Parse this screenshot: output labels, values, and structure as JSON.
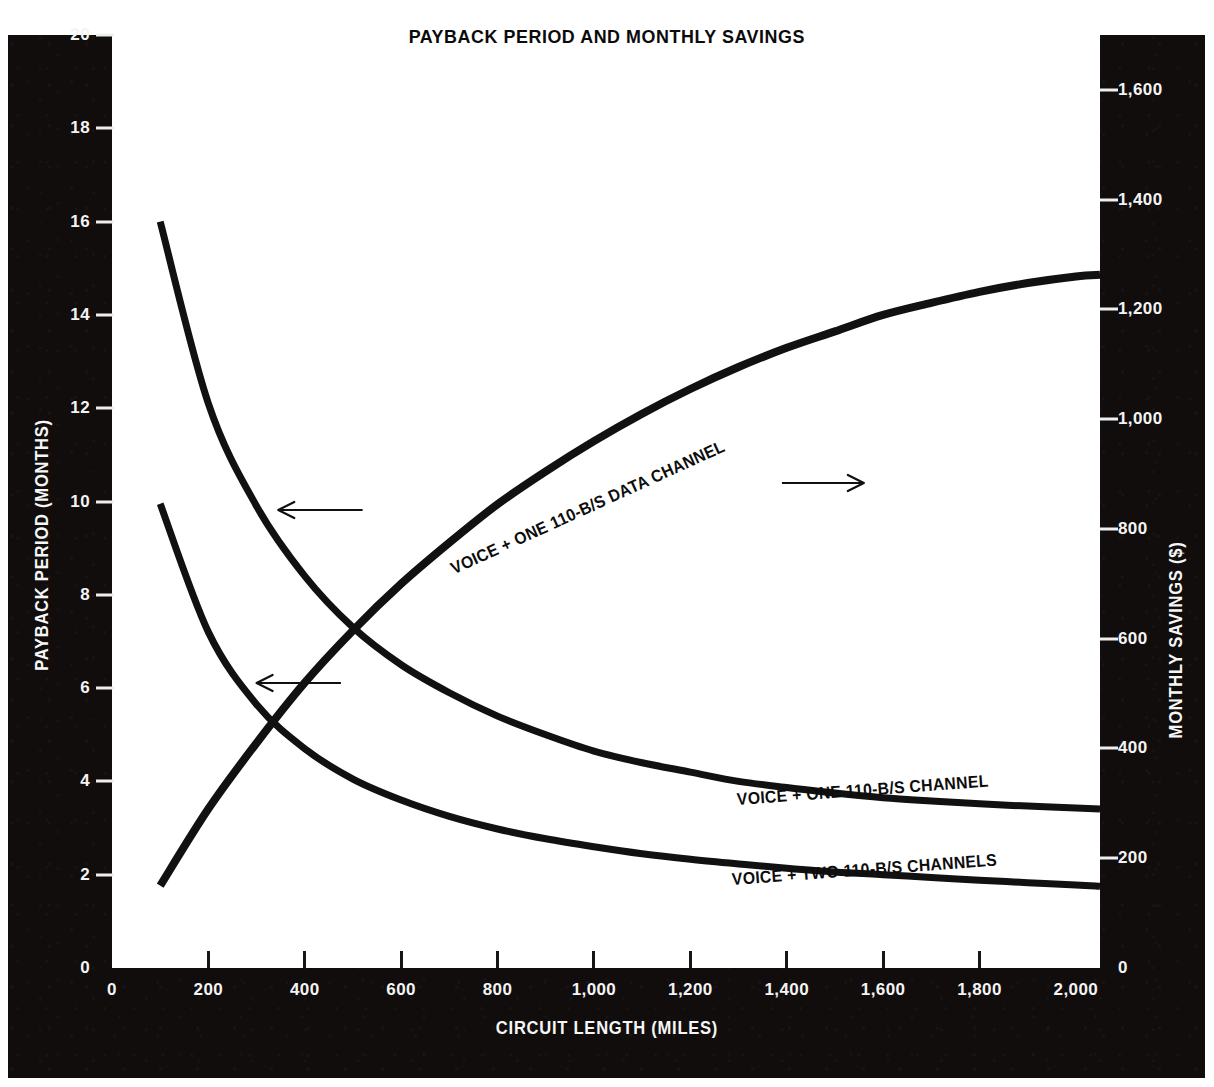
{
  "title": "PAYBACK PERIOD AND MONTHLY SAVINGS",
  "axes": {
    "x_title": "CIRCUIT LENGTH (MILES)",
    "y_left_title": "PAYBACK PERIOD (MONTHS)",
    "y_right_title": "MONTHLY SAVINGS ($)",
    "x_ticks": [
      "0",
      "200",
      "400",
      "600",
      "800",
      "1,000",
      "1,200",
      "1,400",
      "1,600",
      "1,800",
      "2,000"
    ],
    "y_left_ticks": [
      "0",
      "2",
      "4",
      "6",
      "8",
      "10",
      "12",
      "14",
      "16",
      "18",
      "20"
    ],
    "y_right_ticks": [
      "0",
      "200",
      "400",
      "600",
      "800",
      "1,000",
      "1,200",
      "1,400",
      "1,600"
    ]
  },
  "colors": {
    "panel": "#100d0c",
    "plot_background": "#ffffff",
    "curve": "#111111",
    "tick_text": "#f4f4f4",
    "title_text": "#0b0b0b"
  },
  "annotations": [
    {
      "name": "savings-curve-label",
      "text": "VOICE + ONE 110-B/S DATA CHANNEL",
      "arrow": "right-arrow"
    },
    {
      "name": "payback-one-channel-label",
      "text": "VOICE + ONE 110-B/S CHANNEL",
      "arrow": "left-arrow"
    },
    {
      "name": "payback-two-channels-label",
      "text": "VOICE + TWO 110-B/S CHANNELS",
      "arrow": "left-arrow"
    }
  ],
  "chart_data": {
    "type": "line",
    "title": "PAYBACK PERIOD AND MONTHLY SAVINGS",
    "xlabel": "CIRCUIT LENGTH (MILES)",
    "ylabel": "PAYBACK PERIOD (MONTHS)",
    "ylabel_secondary": "MONTHLY SAVINGS ($)",
    "xlim": [
      0,
      2050
    ],
    "ylim": [
      0,
      20
    ],
    "ylim_secondary": [
      0,
      1700
    ],
    "grid": false,
    "legend": "inline-labels",
    "x": [
      100,
      200,
      300,
      400,
      500,
      600,
      700,
      800,
      900,
      1000,
      1100,
      1200,
      1300,
      1400,
      1500,
      1600,
      1700,
      1800,
      1900,
      2000,
      2050
    ],
    "series": [
      {
        "name": "VOICE + ONE 110-B/S DATA CHANNEL",
        "axis": "right",
        "units": "$ per month",
        "arrow": "right",
        "values": [
          150,
          290,
          410,
          520,
          615,
          700,
          775,
          845,
          905,
          960,
          1010,
          1055,
          1095,
          1130,
          1160,
          1190,
          1212,
          1232,
          1248,
          1260,
          1263
        ]
      },
      {
        "name": "VOICE + ONE 110-B/S CHANNEL",
        "axis": "left",
        "units": "months",
        "arrow": "left",
        "values": [
          16.0,
          12.1,
          9.9,
          8.4,
          7.3,
          6.5,
          5.9,
          5.4,
          5.0,
          4.65,
          4.4,
          4.2,
          4.0,
          3.87,
          3.75,
          3.65,
          3.58,
          3.52,
          3.47,
          3.43,
          3.41
        ]
      },
      {
        "name": "VOICE + TWO 110-B/S CHANNELS",
        "axis": "left",
        "units": "months",
        "arrow": "left",
        "values": [
          9.95,
          7.2,
          5.65,
          4.7,
          4.05,
          3.6,
          3.25,
          2.98,
          2.77,
          2.6,
          2.45,
          2.33,
          2.23,
          2.14,
          2.06,
          2.0,
          1.94,
          1.88,
          1.83,
          1.78,
          1.75
        ]
      }
    ]
  }
}
